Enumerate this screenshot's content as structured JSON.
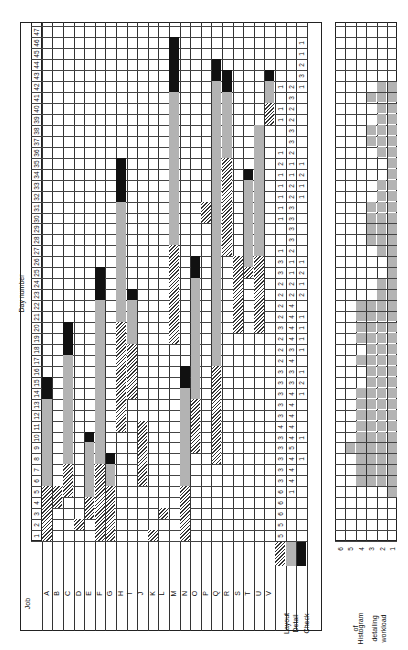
{
  "chart_data": {
    "type": "gantt",
    "orientation": "rotated 90deg counterclockwise",
    "xlabel": "Day number",
    "ylabel": "Job",
    "days": [
      1,
      2,
      3,
      4,
      5,
      6,
      7,
      8,
      9,
      10,
      11,
      12,
      13,
      14,
      15,
      16,
      17,
      18,
      19,
      20,
      21,
      22,
      23,
      24,
      25,
      26,
      27,
      28,
      29,
      30,
      31,
      32,
      33,
      34,
      35,
      36,
      37,
      38,
      39,
      40,
      41,
      42,
      43,
      44,
      45,
      46,
      47
    ],
    "legend": [
      {
        "name": "Layout",
        "pattern": "hatched"
      },
      {
        "name": "Detail",
        "pattern": "dotted"
      },
      {
        "name": "Check",
        "pattern": "solid-black"
      }
    ],
    "jobs": [
      {
        "name": "A",
        "layout": [
          1,
          5
        ],
        "detail": [
          6,
          13
        ],
        "check": [
          14,
          15
        ]
      },
      {
        "name": "B",
        "layout": [
          4,
          5
        ],
        "detail": null,
        "check": null
      },
      {
        "name": "C",
        "layout": [
          5,
          7
        ],
        "detail": [
          8,
          17
        ],
        "check": [
          18,
          20
        ]
      },
      {
        "name": "D",
        "layout": [
          2,
          2
        ],
        "detail": null,
        "check": null
      },
      {
        "name": "E",
        "layout": [
          3,
          4
        ],
        "detail": [
          5,
          9
        ],
        "check": [
          10,
          10
        ]
      },
      {
        "name": "F",
        "layout": [
          1,
          7
        ],
        "detail": [
          8,
          22
        ],
        "check": [
          23,
          25
        ]
      },
      {
        "name": "G",
        "layout": [
          1,
          5
        ],
        "detail": [
          6,
          7
        ],
        "check": [
          8,
          8
        ]
      },
      {
        "name": "H",
        "layout": [
          11,
          20
        ],
        "detail": [
          21,
          31
        ],
        "check": [
          32,
          35
        ]
      },
      {
        "name": "I",
        "layout": [
          14,
          18
        ],
        "detail": [
          19,
          22
        ],
        "check": [
          23,
          23
        ]
      },
      {
        "name": "J",
        "layout": [
          6,
          11
        ],
        "detail": null,
        "check": null
      },
      {
        "name": "K",
        "layout": [
          1,
          1
        ],
        "detail": null,
        "check": null
      },
      {
        "name": "L",
        "layout": [
          3,
          3
        ],
        "detail": null,
        "check": null
      },
      {
        "name": "M",
        "layout": [
          19,
          27
        ],
        "detail": [
          28,
          41
        ],
        "check": [
          42,
          46
        ]
      },
      {
        "name": "N",
        "layout": [
          1,
          5
        ],
        "detail": [
          6,
          14
        ],
        "check": [
          15,
          16
        ]
      },
      {
        "name": "O",
        "layout": [
          9,
          13
        ],
        "detail": [
          14,
          24
        ],
        "check": [
          25,
          26
        ]
      },
      {
        "name": "P",
        "layout": [
          30,
          31
        ],
        "detail": null,
        "check": null
      },
      {
        "name": "Q",
        "layout": [
          8,
          16
        ],
        "detail": [
          17,
          42
        ],
        "check": [
          43,
          44
        ]
      },
      {
        "name": "R",
        "layout": [
          27,
          35
        ],
        "detail": [
          36,
          41
        ],
        "check": [
          42,
          43
        ]
      },
      {
        "name": "S",
        "layout": [
          20,
          26
        ],
        "detail": null,
        "check": null
      },
      {
        "name": "T",
        "layout": [
          25,
          25
        ],
        "detail": [
          26,
          33
        ],
        "check": [
          34,
          34
        ]
      },
      {
        "name": "U",
        "layout": [
          20,
          26
        ],
        "detail": [
          27,
          38
        ],
        "check": null
      },
      {
        "name": "V",
        "layout": [
          39,
          40
        ],
        "detail": [
          41,
          42
        ],
        "check": [
          43,
          43
        ]
      }
    ],
    "totals": {
      "Layout": [
        5,
        5,
        6,
        6,
        6,
        3,
        3,
        3,
        3,
        3,
        4,
        3,
        3,
        3,
        3,
        3,
        2,
        2,
        2,
        3,
        2,
        2,
        2,
        2,
        3,
        3,
        1,
        0,
        0,
        1,
        1,
        1,
        1,
        1,
        2,
        1,
        0,
        0,
        1,
        1,
        0,
        1,
        0,
        0,
        0,
        0,
        0
      ],
      "Detail": [
        0,
        0,
        0,
        0,
        1,
        4,
        4,
        4,
        5,
        4,
        4,
        4,
        4,
        4,
        3,
        3,
        4,
        3,
        4,
        4,
        4,
        4,
        2,
        2,
        1,
        1,
        2,
        3,
        3,
        3,
        3,
        2,
        2,
        1,
        1,
        2,
        3,
        3,
        2,
        2,
        3,
        2,
        0,
        0,
        0,
        0,
        0
      ],
      "Check": [
        0,
        0,
        0,
        0,
        0,
        0,
        0,
        1,
        0,
        1,
        0,
        0,
        0,
        1,
        2,
        1,
        0,
        1,
        1,
        1,
        1,
        0,
        2,
        1,
        2,
        1,
        0,
        0,
        0,
        0,
        0,
        1,
        1,
        2,
        1,
        0,
        0,
        0,
        0,
        0,
        0,
        1,
        3,
        2,
        1,
        1,
        0
      ]
    },
    "histogram": {
      "title": "Histogram of detailing workload",
      "ylabels": [
        "1",
        "2",
        "3",
        "4",
        "5",
        "6"
      ],
      "values": [
        0,
        0,
        0,
        0,
        1,
        4,
        4,
        4,
        5,
        4,
        4,
        4,
        4,
        4,
        3,
        3,
        4,
        3,
        4,
        4,
        4,
        4,
        2,
        2,
        1,
        1,
        2,
        3,
        3,
        3,
        3,
        2,
        2,
        1,
        1,
        2,
        3,
        3,
        2,
        2,
        3,
        2,
        0,
        0,
        0,
        0,
        0
      ]
    }
  },
  "labels": {
    "day_number": "Day number",
    "job": "Job",
    "layout": "Layout",
    "detail": "Detail",
    "check": "Check",
    "histogram": [
      "Histogram",
      "of",
      "detailing",
      "workload"
    ]
  }
}
